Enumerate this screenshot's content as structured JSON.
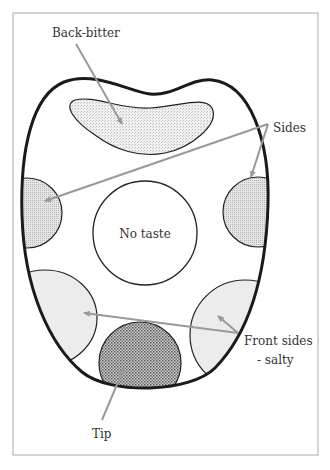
{
  "diagram": {
    "labels": {
      "back": "Back-bitter",
      "sides": "Sides",
      "center": "No taste",
      "front_sides_line1": "Front sides",
      "front_sides_line2": "- salty",
      "tip": "Tip"
    },
    "regions": [
      {
        "name": "back",
        "label": "Back-bitter",
        "fill": "light stipple"
      },
      {
        "name": "sides",
        "label": "Sides",
        "fill": "medium stipple"
      },
      {
        "name": "center",
        "label": "No taste",
        "fill": "none"
      },
      {
        "name": "front-sides",
        "label": "Front sides - salty",
        "fill": "light gray"
      },
      {
        "name": "tip",
        "label": "Tip",
        "fill": "dense crosshatch"
      }
    ],
    "colors": {
      "outline": "#1a1a1a",
      "arrow": "#999999",
      "frame": "#aaaaaa",
      "stipple_light": "#e8e8e8",
      "stipple_medium": "#d8d8d8",
      "front_fill": "#ececec",
      "tip_fill": "#9a9a9a"
    }
  }
}
